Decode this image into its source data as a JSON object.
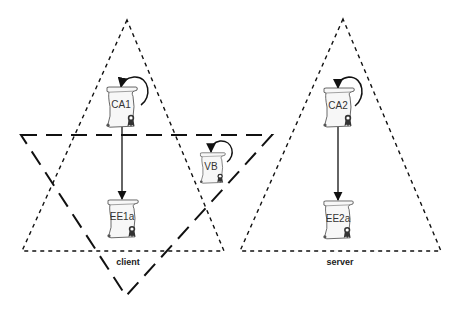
{
  "diagram": {
    "type": "trust-domain diagram",
    "domains": [
      {
        "id": "client",
        "label": "client",
        "shape": "triangle",
        "line": "dotted-dash",
        "points": [
          [
            127,
            20
          ],
          [
            22,
            251
          ],
          [
            224,
            251
          ]
        ],
        "label_pos": [
          128,
          262
        ]
      },
      {
        "id": "server",
        "label": "server",
        "shape": "triangle",
        "line": "dotted-dash",
        "points": [
          [
            343,
            19
          ],
          [
            240,
            251
          ],
          [
            441,
            251
          ]
        ],
        "label_pos": [
          340,
          262
        ]
      },
      {
        "id": "vb-domain",
        "label": "",
        "shape": "inverted-triangle",
        "line": "long-dash",
        "points": [
          [
            21,
            135
          ],
          [
            272,
            135
          ],
          [
            126,
            296
          ]
        ]
      }
    ],
    "certificates": [
      {
        "id": "ca1",
        "label": "CA1",
        "x": 104,
        "y": 86,
        "w": 34,
        "h": 41,
        "self_signed": true
      },
      {
        "id": "ee1a",
        "label": "EE1a",
        "x": 105,
        "y": 199,
        "w": 34,
        "h": 39,
        "self_signed": false
      },
      {
        "id": "vb",
        "label": "VB",
        "x": 198,
        "y": 152,
        "w": 28,
        "h": 31,
        "self_signed": true
      },
      {
        "id": "ca2",
        "label": "CA2",
        "x": 321,
        "y": 87,
        "w": 34,
        "h": 40,
        "self_signed": true
      },
      {
        "id": "ee2a",
        "label": "EE2a",
        "x": 321,
        "y": 200,
        "w": 33,
        "h": 39,
        "self_signed": false
      }
    ],
    "edges": [
      {
        "from": "CA1",
        "to": "EE1a",
        "x": 122,
        "y1": 127,
        "y2": 199
      },
      {
        "from": "CA2",
        "to": "EE2a",
        "x": 338,
        "y1": 127,
        "y2": 200
      }
    ],
    "colors": {
      "line": "#111111",
      "scroll_fill": "#f7f7f7",
      "scroll_stroke": "#444444",
      "seal": "#333333"
    }
  }
}
